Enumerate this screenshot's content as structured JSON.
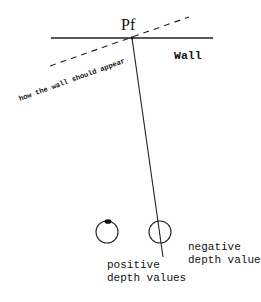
{
  "diagram": {
    "labels": {
      "point": "Pf",
      "wall": "Wall",
      "apparent_wall": "how the wall should appear",
      "positive_line1": "positive",
      "positive_line2": "depth values",
      "negative_line1": "negative",
      "negative_line2": "depth values"
    },
    "colors": {
      "ink": "#111111",
      "background": "#ffffff"
    },
    "elements": {
      "wall_line": {
        "x1": 51,
        "y1": 38,
        "x2": 213,
        "y2": 38
      },
      "dashed_line": {
        "x1": 50,
        "y1": 66,
        "x2": 189,
        "y2": 17
      },
      "sight_line": {
        "x1": 132,
        "y1": 38,
        "x2": 163,
        "y2": 257
      },
      "eye_positive": {
        "cx": 107,
        "cy": 232,
        "r": 11
      },
      "eye_negative": {
        "cx": 160,
        "cy": 232,
        "r": 11
      }
    }
  }
}
